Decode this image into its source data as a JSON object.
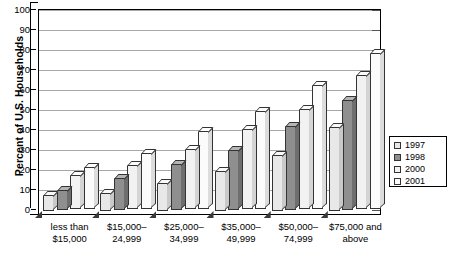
{
  "chart_data": {
    "type": "bar",
    "title": "",
    "subtitle": "",
    "xlabel": "",
    "ylabel": "Percent of U.S. Households",
    "ylim": [
      0,
      100
    ],
    "ytick_step": 10,
    "yticks": [
      100,
      90,
      80,
      70,
      60,
      50,
      40,
      30,
      20,
      10,
      0
    ],
    "grid": true,
    "legend_position": "right",
    "categories": [
      "less than $15,000",
      "$15,000–24,999",
      "$25,000–34,999",
      "$35,000–49,999",
      "$50,000–74,999",
      "$75,000 and above"
    ],
    "category_lines": [
      [
        "less than",
        "$15,000"
      ],
      [
        "$15,000–",
        "24,999"
      ],
      [
        "$25,000–",
        "34,999"
      ],
      [
        "$35,000–",
        "49,999"
      ],
      [
        "$50,000–",
        "74,999"
      ],
      [
        "$75,000 and",
        "above"
      ]
    ],
    "series": [
      {
        "name": "1997",
        "color": "#e8e8e8",
        "values": [
          8,
          9,
          14,
          20,
          28,
          42
        ]
      },
      {
        "name": "1998",
        "color": "#8f8f8f",
        "values": [
          10,
          16,
          23,
          30,
          42,
          55
        ]
      },
      {
        "name": "2000",
        "color": "#f2f2f2",
        "values": [
          17,
          22,
          30,
          40,
          50,
          67
        ]
      },
      {
        "name": "2001",
        "color": "#fbfbfb",
        "values": [
          21,
          28,
          39,
          49,
          62,
          78
        ]
      }
    ]
  },
  "legend": {
    "items": [
      {
        "label": "1997"
      },
      {
        "label": "1998"
      },
      {
        "label": "2000"
      },
      {
        "label": "2001"
      }
    ]
  },
  "axis": {
    "y_title": "Percent of U.S. Households"
  }
}
